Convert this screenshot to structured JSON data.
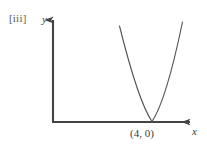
{
  "figure": {
    "part_label": "[iii]",
    "background_color": "#ffffff",
    "axis_color": "#444444",
    "curve_color": "#555555",
    "text_color": "#3c3c3c",
    "width": 207,
    "height": 151
  },
  "axes": {
    "x_label": "x",
    "y_label": "y",
    "origin": {
      "x": 52,
      "y": 122
    },
    "x_axis_end": {
      "x": 195,
      "y": 122
    },
    "y_axis_end": {
      "x": 53,
      "y": 16
    },
    "arrowheads": "both"
  },
  "annotations": [
    {
      "name": "vertex-label",
      "text": "(4, 0)",
      "x": 152,
      "y": 134
    }
  ],
  "chart_data": {
    "type": "line",
    "title": "",
    "subtitle": "",
    "xlabel": "x",
    "ylabel": "y",
    "grid": false,
    "legend": null,
    "curves": [
      {
        "name": "parabola",
        "equation": "y = a(x - 4)^2",
        "vertex": [
          4,
          0
        ],
        "opens": "upward",
        "touches_x_axis_at": [
          4,
          0
        ],
        "path": "M 119.5 26 C 128 60 140 104 152 121.5 C 164 104 175 58 182.5 22",
        "left_arm_top_px": [
          119.5,
          26
        ],
        "right_arm_top_px": [
          182.5,
          22
        ],
        "vertex_px": [
          152,
          121.5
        ]
      }
    ],
    "annotations": [
      "(4, 0)"
    ],
    "xlim": null,
    "ylim": null
  }
}
